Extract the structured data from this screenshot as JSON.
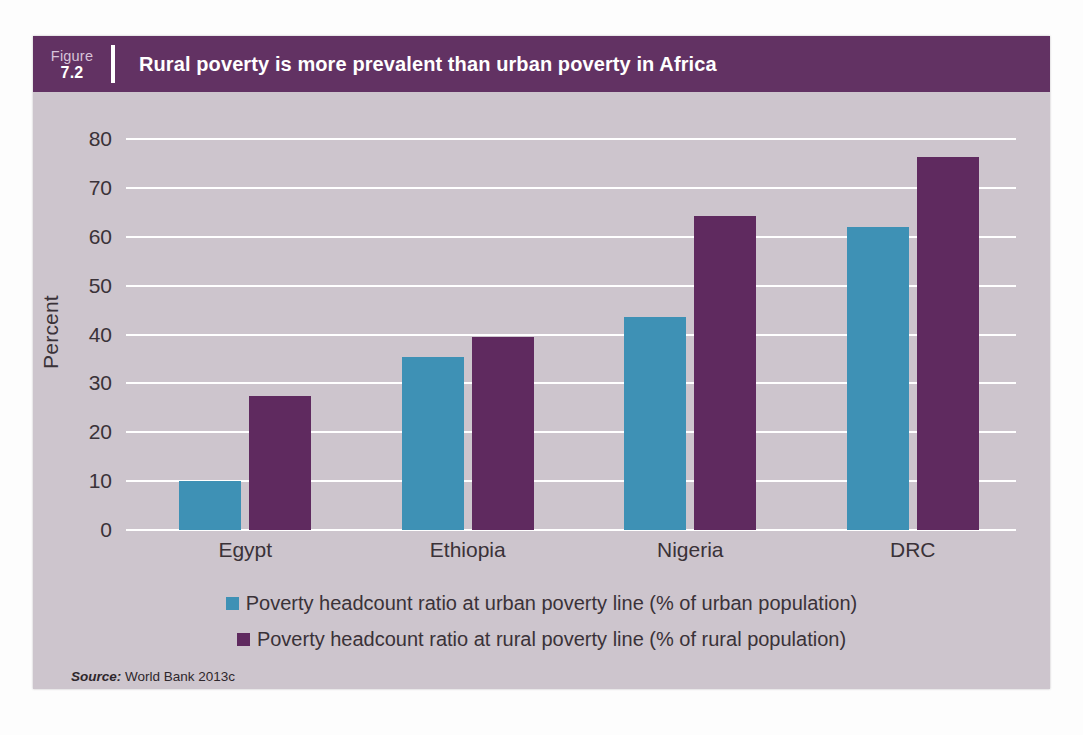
{
  "figure": {
    "label_word": "Figure",
    "number": "7.2",
    "title": "Rural poverty is more prevalent than urban poverty in Africa",
    "source_label": "Source:",
    "source_text": " World Bank 2013c"
  },
  "colors": {
    "header_band": "#623263",
    "plot_background": "#cdc5cd",
    "gridline": "#ffffff",
    "series_urban": "#3e91b5",
    "series_rural": "#5f2a5f",
    "text": "#3a3238"
  },
  "chart_data": {
    "type": "bar",
    "title": "Rural poverty is more prevalent than urban poverty in Africa",
    "xlabel": "",
    "ylabel": "Percent",
    "ylim": [
      0,
      80
    ],
    "yticks": [
      0,
      10,
      20,
      30,
      40,
      50,
      60,
      70,
      80
    ],
    "ytick_labels": [
      "0",
      "10",
      "20",
      "30",
      "40",
      "50",
      "60",
      "70",
      "80"
    ],
    "grid": "horizontal",
    "legend_position": "bottom",
    "categories": [
      "Egypt",
      "Ethiopia",
      "Nigeria",
      "DRC"
    ],
    "series": [
      {
        "name": "Poverty headcount ratio at urban poverty line (% of urban population)",
        "key": "urban",
        "color": "#3e91b5",
        "values": [
          10.0,
          35.3,
          43.6,
          62.0
        ]
      },
      {
        "name": "Poverty headcount ratio at rural poverty line (% of rural population)",
        "key": "rural",
        "color": "#5f2a5f",
        "values": [
          27.4,
          39.5,
          64.2,
          76.3
        ]
      }
    ]
  }
}
